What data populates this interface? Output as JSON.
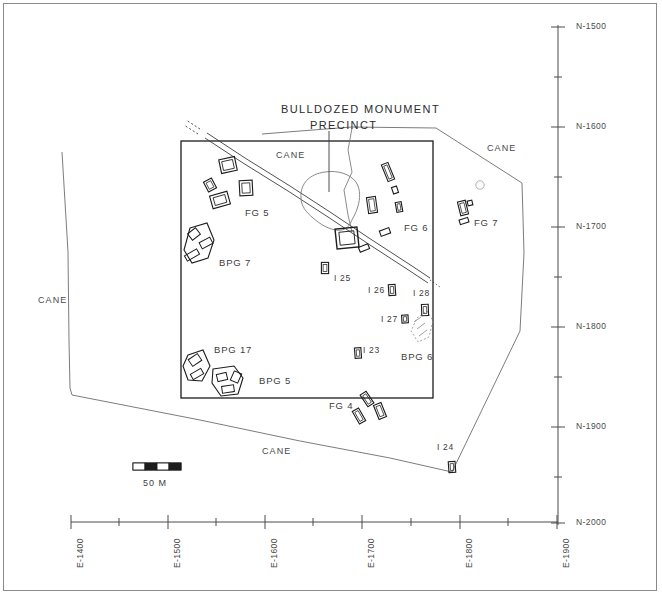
{
  "figure": {
    "type": "archaeological-site-map",
    "title": "BULLDOZED MONUMENT PRECINCT",
    "title_line1": "BULLDOZED MONUMENT",
    "title_line2": "PRECINCT"
  },
  "scale_bar": {
    "label": "50 M",
    "segments": 4
  },
  "axes": {
    "y_axis": {
      "name": "northing",
      "ticks": [
        "N-1500",
        "N-1600",
        "N-1700",
        "N-1800",
        "N-1900",
        "N-2000"
      ],
      "minor_between": 1
    },
    "x_axis": {
      "name": "easting",
      "ticks": [
        "E-1400",
        "E-1500",
        "E-1600",
        "E-1700",
        "E-1800",
        "E-1900"
      ],
      "minor_between": 1
    }
  },
  "cane_labels": [
    {
      "text": "CANE",
      "x": 276,
      "y": 150
    },
    {
      "text": "CANE",
      "x": 487,
      "y": 143
    },
    {
      "text": "CANE",
      "x": 38,
      "y": 295
    },
    {
      "text": "CANE",
      "x": 262,
      "y": 446
    }
  ],
  "group_labels": [
    {
      "text": "FG 5",
      "x": 245,
      "y": 207
    },
    {
      "text": "FG 6",
      "x": 404,
      "y": 227
    },
    {
      "text": "FG 7",
      "x": 474,
      "y": 222
    },
    {
      "text": "FG 4",
      "x": 329,
      "y": 403
    },
    {
      "text": "BPG 7",
      "x": 219,
      "y": 261
    },
    {
      "text": "BPG 17",
      "x": 214,
      "y": 348
    },
    {
      "text": "BPG 5",
      "x": 259,
      "y": 379
    },
    {
      "text": "BPG 6",
      "x": 401,
      "y": 355
    }
  ],
  "mound_labels": [
    {
      "text": "I 25",
      "x": 334,
      "y": 277
    },
    {
      "text": "I 26",
      "x": 369,
      "y": 289
    },
    {
      "text": "I 28",
      "x": 415,
      "y": 292
    },
    {
      "text": "I 27",
      "x": 381,
      "y": 318
    },
    {
      "text": "I 23",
      "x": 363,
      "y": 349
    },
    {
      "text": "I 24",
      "x": 438,
      "y": 446
    }
  ],
  "features": {
    "survey_rectangle": {
      "x": 181,
      "y": 141,
      "width": 252,
      "height": 257
    },
    "precinct_blob_label": "bulldozed monument precinct outline",
    "road_label": "unpaved track",
    "fg5_mounds": 4,
    "fg6_mounds": 6,
    "fg7_mounds": 2,
    "fg4_mounds": 3,
    "bpg_platforms": 4
  },
  "colors": {
    "ink": "#1c1c1c",
    "light_ink": "#6d6d6d",
    "frame": "#8a8a8a",
    "paper": "#ffffff"
  }
}
